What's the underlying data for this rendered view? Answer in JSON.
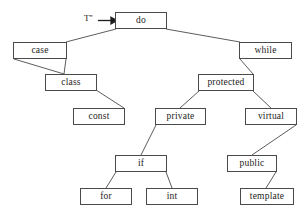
{
  "diagram": {
    "type": "tree",
    "title": "",
    "background_color": "#ffffff",
    "node_fill": "#ffffff",
    "node_border_color": "#4a4a4a",
    "edge_color": "#4a4a4a",
    "text_color": "#1c1c1c",
    "root_pointer": {
      "label": "T''",
      "icon": "arrow-right-icon",
      "points_to": "do"
    },
    "nodes": [
      {
        "id": "do",
        "label": "do",
        "x": 115,
        "y": 12,
        "w": 52,
        "h": 17
      },
      {
        "id": "case",
        "label": "case",
        "x": 13,
        "y": 42,
        "w": 54,
        "h": 17
      },
      {
        "id": "while",
        "label": "while",
        "x": 239,
        "y": 42,
        "w": 53,
        "h": 17
      },
      {
        "id": "class",
        "label": "class",
        "x": 45,
        "y": 74,
        "w": 52,
        "h": 17
      },
      {
        "id": "protected",
        "label": "protected",
        "x": 198,
        "y": 74,
        "w": 56,
        "h": 17
      },
      {
        "id": "const",
        "label": "const",
        "x": 73,
        "y": 108,
        "w": 52,
        "h": 17
      },
      {
        "id": "private",
        "label": "private",
        "x": 155,
        "y": 108,
        "w": 51,
        "h": 17
      },
      {
        "id": "virtual",
        "label": "virtual",
        "x": 245,
        "y": 108,
        "w": 52,
        "h": 17
      },
      {
        "id": "if",
        "label": "if",
        "x": 115,
        "y": 155,
        "w": 52,
        "h": 17
      },
      {
        "id": "public",
        "label": "public",
        "x": 227,
        "y": 155,
        "w": 50,
        "h": 17
      },
      {
        "id": "for",
        "label": "for",
        "x": 80,
        "y": 188,
        "w": 52,
        "h": 17
      },
      {
        "id": "int",
        "label": "int",
        "x": 146,
        "y": 188,
        "w": 52,
        "h": 17
      },
      {
        "id": "template",
        "label": "template",
        "x": 240,
        "y": 188,
        "w": 54,
        "h": 17
      }
    ],
    "edges": [
      {
        "from": "do",
        "to": "case",
        "x1": 116,
        "y1": 29,
        "x2": 66,
        "y2": 42
      },
      {
        "from": "do",
        "to": "while",
        "x1": 166,
        "y1": 29,
        "x2": 240,
        "y2": 42
      },
      {
        "from": "case",
        "to": "class",
        "x1": 14,
        "y1": 59,
        "x2": 64,
        "y2": 74
      },
      {
        "from": "case",
        "to": "class",
        "x1": 66,
        "y1": 59,
        "x2": 64,
        "y2": 74
      },
      {
        "from": "while",
        "to": "protected",
        "x1": 240,
        "y1": 59,
        "x2": 253,
        "y2": 74
      },
      {
        "from": "class",
        "to": "const",
        "x1": 96,
        "y1": 90,
        "x2": 124,
        "y2": 108
      },
      {
        "from": "protected",
        "to": "private",
        "x1": 199,
        "y1": 91,
        "x2": 180,
        "y2": 108
      },
      {
        "from": "protected",
        "to": "virtual",
        "x1": 253,
        "y1": 91,
        "x2": 271,
        "y2": 108
      },
      {
        "from": "private",
        "to": "if",
        "x1": 156,
        "y1": 125,
        "x2": 141,
        "y2": 155
      },
      {
        "from": "virtual",
        "to": "public",
        "x1": 296,
        "y1": 125,
        "x2": 252,
        "y2": 155
      },
      {
        "from": "if",
        "to": "for",
        "x1": 116,
        "y1": 172,
        "x2": 106,
        "y2": 188
      },
      {
        "from": "if",
        "to": "int",
        "x1": 166,
        "y1": 172,
        "x2": 172,
        "y2": 188
      },
      {
        "from": "public",
        "to": "template",
        "x1": 276,
        "y1": 172,
        "x2": 266,
        "y2": 188
      }
    ]
  }
}
